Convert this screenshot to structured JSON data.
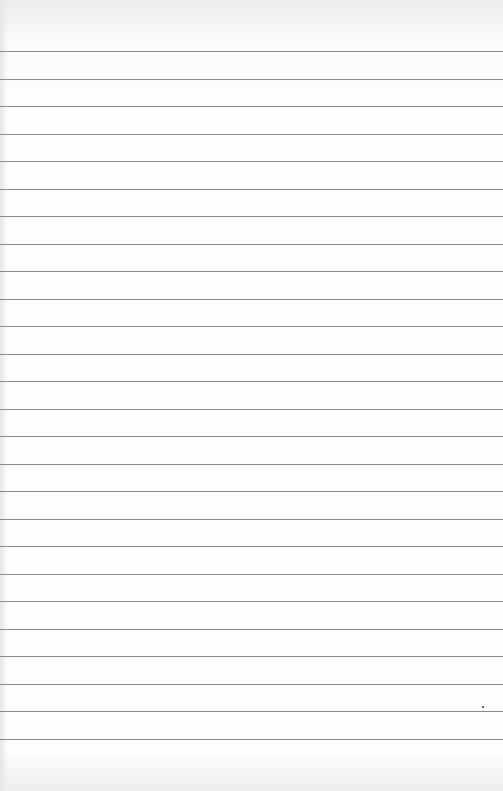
{
  "paper": {
    "type": "lined notepaper",
    "line_color": "#8a8a8a",
    "line_count": 26,
    "first_line_y": 51,
    "line_spacing": 27.5,
    "mark": {
      "x": 482,
      "y": 706
    }
  }
}
